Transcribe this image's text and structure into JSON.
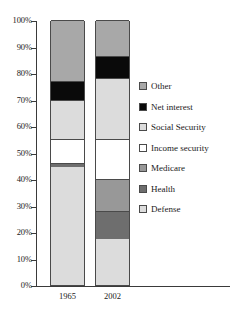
{
  "chart_data": {
    "type": "bar",
    "subtype": "stacked-100-percent",
    "title": "",
    "xlabel": "",
    "ylabel": "",
    "categories": [
      "1965",
      "2002"
    ],
    "ylim": [
      0,
      100
    ],
    "ytick_labels": [
      "0%",
      "10%",
      "20%",
      "30%",
      "40%",
      "50%",
      "60%",
      "70%",
      "80%",
      "90%",
      "100%"
    ],
    "ytick_values": [
      0,
      10,
      20,
      30,
      40,
      50,
      60,
      70,
      80,
      90,
      100
    ],
    "grid": false,
    "legend_position": "right",
    "stack_order_top_to_bottom": [
      "Other",
      "Net interest",
      "Social Security",
      "Income security",
      "Medicare",
      "Health",
      "Defense"
    ],
    "series": [
      {
        "name": "Other",
        "color": "#a8a8a8",
        "values": [
          23.0,
          13.5
        ]
      },
      {
        "name": "Net interest",
        "color": "#0a0a0a",
        "values": [
          7.0,
          8.5
        ]
      },
      {
        "name": "Social Security",
        "color": "#dcdcdc",
        "values": [
          15.0,
          23.0
        ]
      },
      {
        "name": "Income security",
        "color": "#ffffff",
        "values": [
          9.0,
          15.0
        ]
      },
      {
        "name": "Medicare",
        "color": "#989898",
        "values": [
          0.0,
          12.0
        ]
      },
      {
        "name": "Health",
        "color": "#6e6e6e",
        "values": [
          1.5,
          10.5
        ]
      },
      {
        "name": "Defense",
        "color": "#dcdcdc",
        "values": [
          44.5,
          17.5
        ]
      }
    ],
    "bars": [
      {
        "category": "1965",
        "segments": [
          {
            "name": "Defense",
            "value": 44.5,
            "from": 0.0,
            "to": 44.5
          },
          {
            "name": "Health",
            "value": 1.5,
            "from": 44.5,
            "to": 46.0
          },
          {
            "name": "Income security",
            "value": 9.0,
            "from": 46.0,
            "to": 55.0
          },
          {
            "name": "Social Security",
            "value": 15.0,
            "from": 55.0,
            "to": 70.0
          },
          {
            "name": "Net interest",
            "value": 7.0,
            "from": 70.0,
            "to": 77.0
          },
          {
            "name": "Other",
            "value": 23.0,
            "from": 77.0,
            "to": 100.0
          }
        ]
      },
      {
        "category": "2002",
        "segments": [
          {
            "name": "Defense",
            "value": 17.5,
            "from": 0.0,
            "to": 17.5
          },
          {
            "name": "Health",
            "value": 10.5,
            "from": 17.5,
            "to": 28.0
          },
          {
            "name": "Medicare",
            "value": 12.0,
            "from": 28.0,
            "to": 40.0
          },
          {
            "name": "Income security",
            "value": 15.0,
            "from": 40.0,
            "to": 55.0
          },
          {
            "name": "Social Security",
            "value": 23.0,
            "from": 55.0,
            "to": 78.0
          },
          {
            "name": "Net interest",
            "value": 8.5,
            "from": 78.0,
            "to": 86.5
          },
          {
            "name": "Other",
            "value": 13.5,
            "from": 86.5,
            "to": 100.0
          }
        ]
      }
    ]
  },
  "legend": {
    "items": [
      {
        "label": "Other",
        "color": "#a8a8a8"
      },
      {
        "label": "Net interest",
        "color": "#0a0a0a"
      },
      {
        "label": "Social Security",
        "color": "#dcdcdc"
      },
      {
        "label": "Income security",
        "color": "#ffffff"
      },
      {
        "label": "Medicare",
        "color": "#989898"
      },
      {
        "label": "Health",
        "color": "#6e6e6e"
      },
      {
        "label": "Defense",
        "color": "#dcdcdc"
      }
    ]
  },
  "colors": {
    "axis": "#3a3a3a",
    "segment_border": "#4a4a4a",
    "text": "#1a1a1a",
    "background": "#ffffff"
  }
}
